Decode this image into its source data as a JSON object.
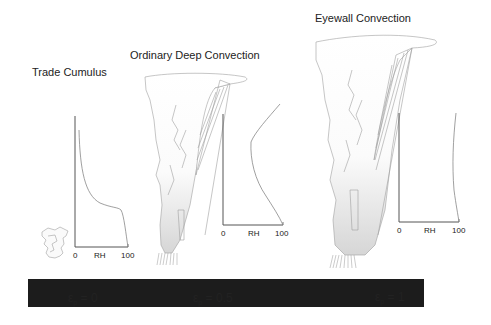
{
  "panels": [
    {
      "title": "Trade Cumulus",
      "epsilon_symbol": "ε",
      "epsilon_subscript": "p",
      "epsilon_value": "= 0",
      "rh_axis": {
        "min_label": "0",
        "label": "RH",
        "max_label": "100"
      }
    },
    {
      "title": "Ordinary Deep Convection",
      "epsilon_symbol": "ε",
      "epsilon_subscript": "p",
      "epsilon_value": "= 0.5",
      "rh_axis": {
        "min_label": "0",
        "label": "RH",
        "max_label": "100"
      }
    },
    {
      "title": "Eyewall Convection",
      "epsilon_symbol": "ε",
      "epsilon_subscript": "p",
      "epsilon_value": "= 1",
      "rh_axis": {
        "min_label": "0",
        "label": "RH",
        "max_label": "100"
      }
    }
  ],
  "colors": {
    "ground_bar": "#1c1c1c",
    "cloud_outline": "#9a9a9a",
    "axis": "#555555",
    "background": "#ffffff"
  }
}
